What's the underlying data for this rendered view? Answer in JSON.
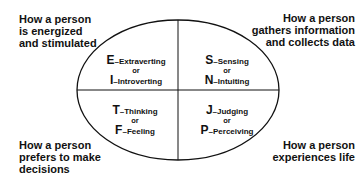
{
  "diagram": {
    "shape": "ellipse divided into four quadrants",
    "stroke_color": "#111111",
    "corner_labels": {
      "top_left": [
        "How a person",
        "is energized",
        "and stimulated"
      ],
      "top_right": [
        "How a person",
        "gathers information",
        "and collects data"
      ],
      "bottom_left": [
        "How a person",
        "prefers to make",
        "decisions"
      ],
      "bottom_right": [
        "How a person",
        "experiences life"
      ]
    },
    "quadrants": {
      "top_left": {
        "first_letter": "E",
        "first_label": "–Extraverting",
        "connector": "or",
        "second_letter": "I",
        "second_label": "–Introverting"
      },
      "top_right": {
        "first_letter": "S",
        "first_label": "–Sensing",
        "connector": "or",
        "second_letter": "N",
        "second_label": "–Intuiting"
      },
      "bottom_left": {
        "first_letter": "T",
        "first_label": "–Thinking",
        "connector": "or",
        "second_letter": "F",
        "second_label": "–Feeling"
      },
      "bottom_right": {
        "first_letter": "J",
        "first_label": "–Judging",
        "connector": "or",
        "second_letter": "P",
        "second_label": "–Perceiving"
      }
    }
  }
}
